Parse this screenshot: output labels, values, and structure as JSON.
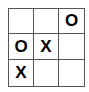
{
  "board": {
    "cells": [
      [
        "",
        "",
        "O"
      ],
      [
        "O",
        "X",
        ""
      ],
      [
        "X",
        "",
        ""
      ]
    ]
  }
}
